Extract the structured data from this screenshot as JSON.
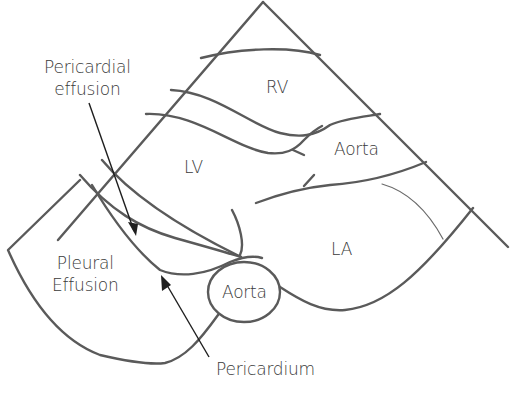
{
  "diagram": {
    "colors": {
      "outline": "#5a5a5a",
      "arrow": "#1e1e1e",
      "text": "#3a3a3a",
      "background": "#ffffff"
    },
    "structures": {
      "rv": "RV",
      "lv": "LV",
      "la": "LA",
      "aorta_outflow": "Aorta",
      "aorta_descending": "Aorta",
      "pleural_effusion_line1": "Pleural",
      "pleural_effusion_line2": "Effusion"
    },
    "annotations": {
      "pericardial_effusion_line1": "Pericardial",
      "pericardial_effusion_line2": "effusion",
      "pericardium": "Pericardium"
    }
  }
}
